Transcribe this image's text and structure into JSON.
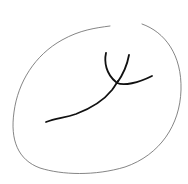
{
  "sketch": {
    "background": "#ffffff",
    "outline_color": "#555555",
    "stroke_color": "#111111",
    "description": "hand-drawn oval with a branching line inside"
  }
}
